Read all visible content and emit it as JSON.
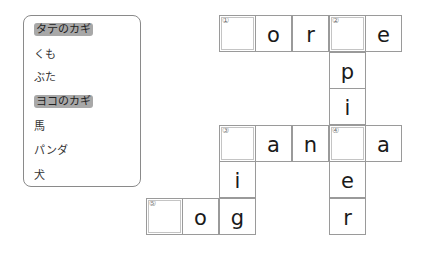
{
  "clues": {
    "vertical_header": "タテのカギ",
    "vertical": [
      "くも",
      "ぶた"
    ],
    "horizontal_header": "ヨコのカギ",
    "horizontal": [
      "馬",
      "パンダ",
      "犬"
    ]
  },
  "grid": {
    "cells": [
      {
        "row": 0,
        "col": 2,
        "num": "①",
        "letter": ""
      },
      {
        "row": 0,
        "col": 3,
        "num": "",
        "letter": "o"
      },
      {
        "row": 0,
        "col": 4,
        "num": "",
        "letter": "r"
      },
      {
        "row": 0,
        "col": 5,
        "num": "②",
        "letter": ""
      },
      {
        "row": 0,
        "col": 6,
        "num": "",
        "letter": "e"
      },
      {
        "row": 1,
        "col": 5,
        "num": "",
        "letter": "p"
      },
      {
        "row": 2,
        "col": 5,
        "num": "",
        "letter": "i"
      },
      {
        "row": 3,
        "col": 2,
        "num": "③",
        "letter": ""
      },
      {
        "row": 3,
        "col": 3,
        "num": "",
        "letter": "a"
      },
      {
        "row": 3,
        "col": 4,
        "num": "",
        "letter": "n"
      },
      {
        "row": 3,
        "col": 5,
        "num": "④",
        "letter": ""
      },
      {
        "row": 3,
        "col": 6,
        "num": "",
        "letter": "a"
      },
      {
        "row": 4,
        "col": 2,
        "num": "",
        "letter": "i"
      },
      {
        "row": 4,
        "col": 5,
        "num": "",
        "letter": "e"
      },
      {
        "row": 5,
        "col": 0,
        "num": "⑤",
        "letter": ""
      },
      {
        "row": 5,
        "col": 1,
        "num": "",
        "letter": "o"
      },
      {
        "row": 5,
        "col": 2,
        "num": "",
        "letter": "g"
      },
      {
        "row": 5,
        "col": 5,
        "num": "",
        "letter": "r"
      }
    ]
  }
}
